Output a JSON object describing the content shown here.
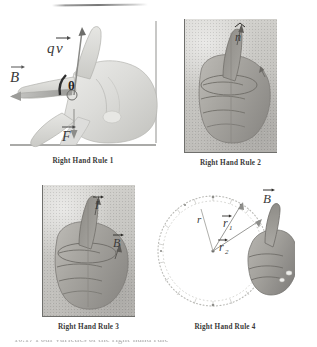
{
  "page": {
    "background_color": "#ffffff",
    "photo_tone": "#c8c7c3",
    "ink_color": "#3a3a3a",
    "top_rule": "horizontal-hairline-artifact",
    "clipped_bottom_text": "10.17  Four varieties of the right-hand rule"
  },
  "figures": [
    {
      "id": "rhr1",
      "caption": "Right Hand Rule 1",
      "description": "open right hand, fingers point along B, thumb-side along qv, palm pushes F",
      "labels": [
        {
          "name": "qv-label",
          "text": "qv⃗",
          "sub": ""
        },
        {
          "name": "b-label",
          "text": "B⃗",
          "sub": ""
        },
        {
          "name": "theta-label",
          "text": "θ",
          "sub": ""
        },
        {
          "name": "f-label",
          "text": "F⃗",
          "sub": ""
        }
      ]
    },
    {
      "id": "rhr2",
      "caption": "Right Hand Rule 2",
      "description": "fisted right hand with thumb up, curled fingers show circulation, thumb is normal",
      "labels": [
        {
          "name": "n-hat-label",
          "text": "n̂",
          "sub": ""
        }
      ]
    },
    {
      "id": "rhr3",
      "caption": "Right Hand Rule 3",
      "description": "fisted right hand with thumb up along current I, curled fingers give B",
      "labels": [
        {
          "name": "i-label",
          "text": "I⃗",
          "sub": ""
        },
        {
          "name": "b-label",
          "text": "B⃗",
          "sub": ""
        }
      ]
    },
    {
      "id": "rhr4",
      "caption": "Right Hand Rule 4",
      "description": "dashed circular loop with radius vectors from center; right hand at the right edge with thumb up, B along thumb",
      "labels": [
        {
          "name": "r-label",
          "text": "r",
          "sub": ""
        },
        {
          "name": "r1-label",
          "text": "r⃗",
          "sub": "1"
        },
        {
          "name": "r2-label",
          "text": "r⃗",
          "sub": "2"
        },
        {
          "name": "b-label",
          "text": "B⃗",
          "sub": ""
        }
      ],
      "circle": {
        "tick_count": 72,
        "style": "dotted-ring",
        "center_dot": true
      }
    }
  ]
}
